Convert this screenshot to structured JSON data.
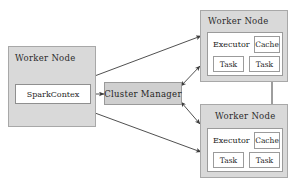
{
  "diagram": {
    "colors": {
      "node_fill": "#d9d9d9",
      "node_border": "#a8a8a8",
      "inner_fill": "#ffffff",
      "inner_border": "#9b9b9b",
      "manager_fill": "#cfcfcf",
      "arrow": "#3c3c3c",
      "background": "#ffffff"
    },
    "driver_node": {
      "title": "Worker Node",
      "context_label": "SparkContex"
    },
    "cluster_manager": {
      "label": "Cluster Manager"
    },
    "worker_nodes": [
      {
        "title": "Worker Node",
        "executor_label": "Executor",
        "cache_label": "Cache",
        "tasks": [
          "Task",
          "Task"
        ]
      },
      {
        "title": "Worker Node",
        "executor_label": "Executor",
        "cache_label": "Cache",
        "tasks": [
          "Task",
          "Task"
        ]
      }
    ],
    "connections": [
      {
        "name": "sparkcontext-to-worker-top",
        "style": "double-headed"
      },
      {
        "name": "sparkcontext-to-worker-bottom",
        "style": "double-headed"
      },
      {
        "name": "sparkcontext-to-cluster-manager",
        "style": "double-headed"
      },
      {
        "name": "cluster-manager-to-worker-top",
        "style": "double-headed"
      },
      {
        "name": "cluster-manager-to-worker-bottom",
        "style": "double-headed"
      },
      {
        "name": "worker-top-to-worker-bottom",
        "style": "double-headed"
      }
    ]
  }
}
